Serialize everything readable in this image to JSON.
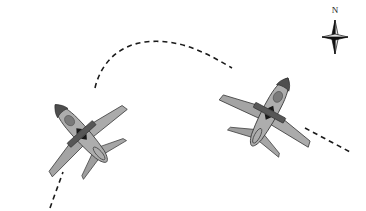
{
  "figure": {
    "kind": "aircraft-maneuver-diagram",
    "view": "plan-view-from-above",
    "background_color": "#ffffff",
    "width": 366,
    "height": 211
  },
  "compass": {
    "north_label": "N",
    "icon": "compass-star-icon",
    "points": 4,
    "center_x": 335,
    "center_y": 37,
    "long_arm": 17,
    "short_arm": 13,
    "dark_color": "#101010",
    "light_color": "#e6e6e6",
    "label_x": 335,
    "label_y": 13
  },
  "palette": {
    "body_fill": "#a9a9a9",
    "body_fill_light": "#b6b6b6",
    "wing_fill": "#a2a2a2",
    "wing_fill_dark": "#9a9a9a",
    "outline": "#3a3a3a",
    "nose_dark": "#4e4e4e",
    "canopy_dark": "#767676",
    "band_dark": "#555555",
    "marker_dark": "#1c1c1c",
    "path_dash": "#1a1a1a"
  },
  "flight_path": {
    "name": "dashed-flight-path",
    "style": "dashed",
    "dash_pattern": "5,4",
    "stroke_width": 1.6,
    "color": "#1a1a1a",
    "inbound_segment": "M 50,208 L 63,172",
    "arc_segment": "M 95,88 C 101,62 120,45 145,42 C 178,38 205,52 232,68",
    "outbound_segment": "M 305,128 L 352,153",
    "description": "curved track from lower-left through apex to lower-right"
  },
  "aircraft": [
    {
      "id": "aircraft-left",
      "name": "left-aircraft",
      "heading_label": "northeast",
      "rotation_deg": -42,
      "center_x": 78,
      "center_y": 130,
      "scale": 1.0,
      "marking": {
        "name": "control-band",
        "band_color": "#555555",
        "marker_up": "triangle-up-marker",
        "marker_down": "triangle-down-marker"
      }
    },
    {
      "id": "aircraft-right",
      "name": "right-aircraft",
      "heading_label": "southeast",
      "rotation_deg": 28,
      "center_x": 272,
      "center_y": 108,
      "scale": 1.0,
      "marking": {
        "name": "control-band",
        "band_color": "#555555",
        "marker_up": "triangle-up-marker",
        "marker_down": "triangle-down-marker"
      }
    }
  ]
}
